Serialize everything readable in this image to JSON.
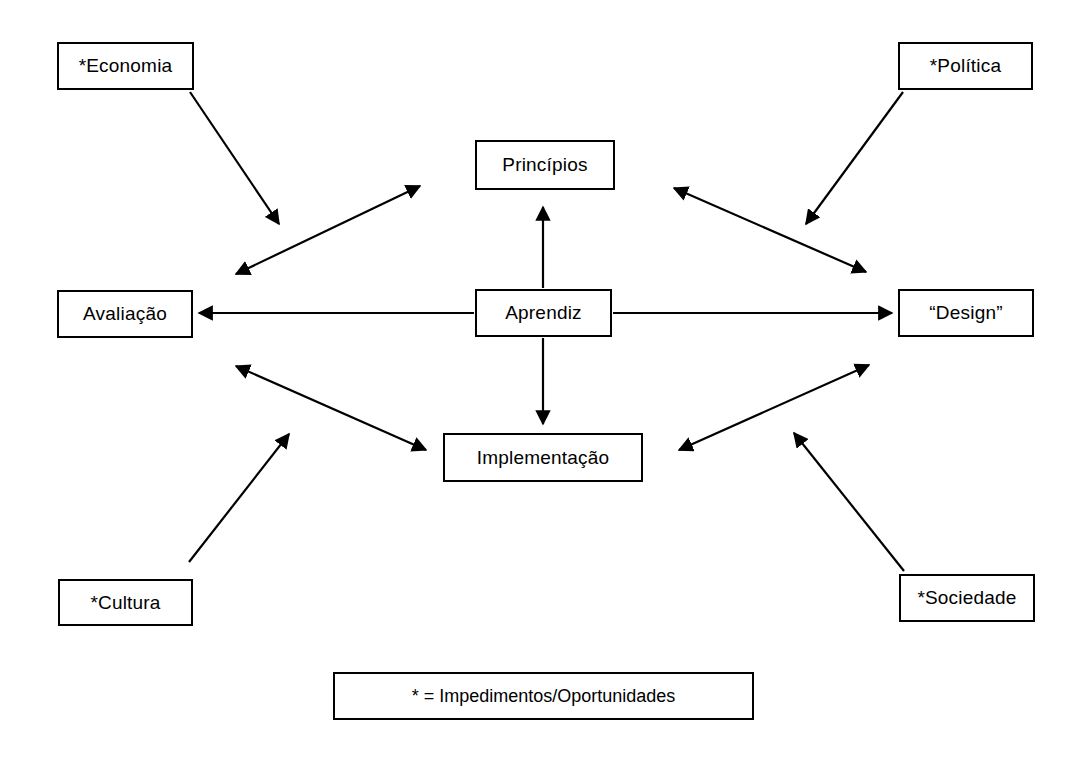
{
  "diagram": {
    "title_text": "",
    "stroke_color": "#000000",
    "background_color": "#ffffff",
    "nodes": [
      {
        "id": "economia",
        "label": "*Economia",
        "x": 57,
        "y": 42,
        "w": 137,
        "h": 48
      },
      {
        "id": "politica",
        "label": "*Política",
        "x": 898,
        "y": 42,
        "w": 135,
        "h": 48
      },
      {
        "id": "principios",
        "label": "Princípios",
        "x": 475,
        "y": 140,
        "w": 140,
        "h": 50
      },
      {
        "id": "avaliacao",
        "label": "Avaliação",
        "x": 57,
        "y": 290,
        "w": 136,
        "h": 48
      },
      {
        "id": "aprendiz",
        "label": "Aprendiz",
        "x": 475,
        "y": 289,
        "w": 137,
        "h": 48
      },
      {
        "id": "design",
        "label": "“Design”",
        "x": 898,
        "y": 289,
        "w": 136,
        "h": 48
      },
      {
        "id": "implementacao",
        "label": "Implementação",
        "x": 443,
        "y": 433,
        "w": 200,
        "h": 49
      },
      {
        "id": "cultura",
        "label": "*Cultura",
        "x": 58,
        "y": 579,
        "w": 135,
        "h": 47
      },
      {
        "id": "sociedade",
        "label": "*Sociedade",
        "x": 899,
        "y": 574,
        "w": 136,
        "h": 48
      }
    ],
    "edges": [
      {
        "id": "economia-to-center",
        "from": "economia",
        "to": "avaliacao-principios-axis",
        "arrows": "single",
        "x1": 190,
        "y1": 92,
        "x2": 279,
        "y2": 224
      },
      {
        "id": "avaliacao-principios",
        "from": "avaliacao",
        "to": "principios",
        "arrows": "double",
        "x1": 236,
        "y1": 274,
        "x2": 420,
        "y2": 186
      },
      {
        "id": "politica-to-center",
        "from": "politica",
        "to": "design-principios-axis",
        "arrows": "single",
        "x1": 903,
        "y1": 92,
        "x2": 806,
        "y2": 224
      },
      {
        "id": "principios-design",
        "from": "principios",
        "to": "design",
        "arrows": "double",
        "x1": 674,
        "y1": 188,
        "x2": 866,
        "y2": 272
      },
      {
        "id": "aprendiz-principios",
        "from": "aprendiz",
        "to": "principios",
        "arrows": "single",
        "x1": 543,
        "y1": 288,
        "x2": 543,
        "y2": 207
      },
      {
        "id": "aprendiz-implementacao",
        "from": "aprendiz",
        "to": "implementacao",
        "arrows": "single",
        "x1": 543,
        "y1": 338,
        "x2": 543,
        "y2": 424
      },
      {
        "id": "aprendiz-avaliacao",
        "from": "aprendiz",
        "to": "avaliacao",
        "arrows": "single",
        "x1": 474,
        "y1": 313,
        "x2": 199,
        "y2": 313
      },
      {
        "id": "aprendiz-design",
        "from": "aprendiz",
        "to": "design",
        "arrows": "single",
        "x1": 613,
        "y1": 313,
        "x2": 892,
        "y2": 313
      },
      {
        "id": "avaliacao-implementacao",
        "from": "avaliacao",
        "to": "implementacao",
        "arrows": "double",
        "x1": 236,
        "y1": 366,
        "x2": 426,
        "y2": 450
      },
      {
        "id": "cultura-to-center",
        "from": "cultura",
        "to": "avaliacao-implementacao-axis",
        "arrows": "single",
        "x1": 189,
        "y1": 562,
        "x2": 289,
        "y2": 434
      },
      {
        "id": "implementacao-design",
        "from": "implementacao",
        "to": "design",
        "arrows": "double",
        "x1": 679,
        "y1": 450,
        "x2": 869,
        "y2": 365
      },
      {
        "id": "sociedade-to-center",
        "from": "sociedade",
        "to": "implementacao-design-axis",
        "arrows": "single",
        "x1": 904,
        "y1": 571,
        "x2": 794,
        "y2": 433
      }
    ],
    "legend": {
      "id": "legend",
      "text": "*  =  Impedimentos/Oportunidades",
      "x": 333,
      "y": 672,
      "w": 421,
      "h": 48
    }
  }
}
